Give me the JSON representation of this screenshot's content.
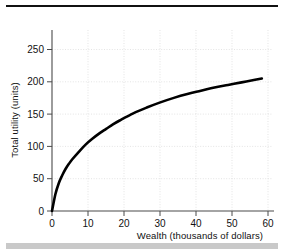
{
  "figure": {
    "top_rule": "top-rule",
    "bottom_bar": "bottom-bar"
  },
  "chart_data": {
    "type": "line",
    "title": "",
    "xlabel": "Wealth (thousands of dollars)",
    "ylabel": "Total utility (units)",
    "xlim": [
      0,
      65
    ],
    "ylim": [
      0,
      280
    ],
    "xticks": [
      0,
      10,
      20,
      30,
      40,
      50,
      60
    ],
    "xtick_labels": [
      "0",
      "10",
      "20",
      "30",
      "40",
      "50",
      "60"
    ],
    "yticks": [
      0,
      50,
      100,
      150,
      200,
      250
    ],
    "ytick_labels": [
      "0",
      "50",
      "100",
      "150",
      "200",
      "250"
    ],
    "grid": true,
    "grid_style": "dotted",
    "legend": null,
    "series": [
      {
        "name": "Total utility",
        "color": "#000000",
        "x": [
          0,
          1,
          2,
          3,
          4,
          5,
          6,
          8,
          10,
          12,
          14,
          16,
          18,
          20,
          24,
          28,
          32,
          36,
          40,
          44,
          48,
          52,
          56,
          60,
          62
        ],
        "y": [
          0,
          26,
          43,
          55,
          65,
          73,
          80,
          92,
          103,
          112,
          120,
          127,
          134,
          140,
          151,
          160,
          168,
          175,
          181,
          186,
          191,
          195,
          199,
          203,
          205
        ]
      }
    ]
  }
}
